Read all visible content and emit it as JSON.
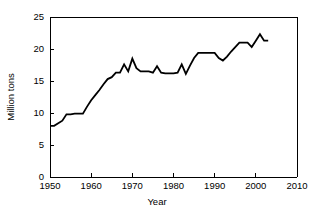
{
  "chart_data": {
    "type": "line",
    "title": "",
    "subtitle": "",
    "xlabel": "Year",
    "ylabel": "Million tons",
    "xlim": [
      1950,
      2010
    ],
    "ylim": [
      0,
      25
    ],
    "grid": false,
    "legend": null,
    "xticks": [
      1950,
      1960,
      1970,
      1980,
      1990,
      2000,
      2010
    ],
    "yticks": [
      0,
      5,
      10,
      15,
      20,
      25
    ],
    "xtick_labels": [
      "1950",
      "1960",
      "1970",
      "1980",
      "1990",
      "2000",
      "2010"
    ],
    "ytick_labels": [
      "0",
      "5",
      "10",
      "15",
      "20",
      "25"
    ],
    "series": [
      {
        "name": "Million tons",
        "color": "#000000",
        "x": [
          1950,
          1951,
          1952,
          1953,
          1954,
          1955,
          1956,
          1957,
          1958,
          1959,
          1960,
          1961,
          1962,
          1963,
          1964,
          1965,
          1966,
          1967,
          1968,
          1969,
          1970,
          1971,
          1972,
          1973,
          1974,
          1975,
          1976,
          1977,
          1978,
          1979,
          1980,
          1981,
          1982,
          1983,
          1984,
          1985,
          1986,
          1987,
          1988,
          1989,
          1990,
          1991,
          1992,
          1993,
          1994,
          1995,
          1996,
          1997,
          1998,
          1999,
          2000,
          2001,
          2002,
          2003
        ],
        "values": [
          8.0,
          8.0,
          8.4,
          8.8,
          9.8,
          9.8,
          9.9,
          9.9,
          9.9,
          11.0,
          12.0,
          12.8,
          13.6,
          14.5,
          15.3,
          15.6,
          16.3,
          16.3,
          17.6,
          16.5,
          18.5,
          17.0,
          16.5,
          16.5,
          16.5,
          16.3,
          17.3,
          16.3,
          16.2,
          16.2,
          16.2,
          16.3,
          17.6,
          16.1,
          17.4,
          18.6,
          19.4,
          19.4,
          19.4,
          19.4,
          19.4,
          18.6,
          18.2,
          18.8,
          19.6,
          20.3,
          21.0,
          21.0,
          21.0,
          20.3,
          21.3,
          22.3,
          21.3,
          21.3
        ]
      }
    ]
  },
  "axes": {
    "y_axis_title": "Million tons",
    "x_axis_title": "Year"
  }
}
